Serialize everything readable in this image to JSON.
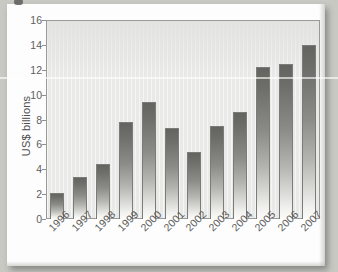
{
  "chart_data": {
    "type": "bar",
    "title": "",
    "subtitle": "",
    "xlabel": "",
    "ylabel": "US$ billions",
    "categories": [
      "1996",
      "1997",
      "1998",
      "1999",
      "2000",
      "2001",
      "2002",
      "2003",
      "2004",
      "2005",
      "2006",
      "2007"
    ],
    "values": [
      2.1,
      3.4,
      4.4,
      7.8,
      9.4,
      7.3,
      5.4,
      7.5,
      8.6,
      12.2,
      12.5,
      14.0
    ],
    "ylim": [
      0,
      16
    ],
    "yticks": [
      0,
      2,
      4,
      6,
      8,
      10,
      12,
      14,
      16
    ],
    "ytick_labels": [
      "0",
      "2",
      "4",
      "6",
      "8",
      "10",
      "12",
      "14",
      "16"
    ],
    "grid": false,
    "legend": null,
    "legend_position": "none",
    "annotations": [],
    "series": [
      {
        "name": "US$ billions",
        "values": [
          2.1,
          3.4,
          4.4,
          7.8,
          9.4,
          7.3,
          5.4,
          7.5,
          8.6,
          12.2,
          12.5,
          14.0
        ]
      }
    ],
    "colors": {
      "bar_top": "#63635f",
      "bar_bottom": "#fbfbfa",
      "bar_outline": "#7b7b77",
      "plot_background": "#e9e9e7",
      "plot_frame": "#9a9a98",
      "page_background": "#fdfdfd",
      "scan_background": "#c9c9c4",
      "text": "#5a5a5a"
    }
  }
}
